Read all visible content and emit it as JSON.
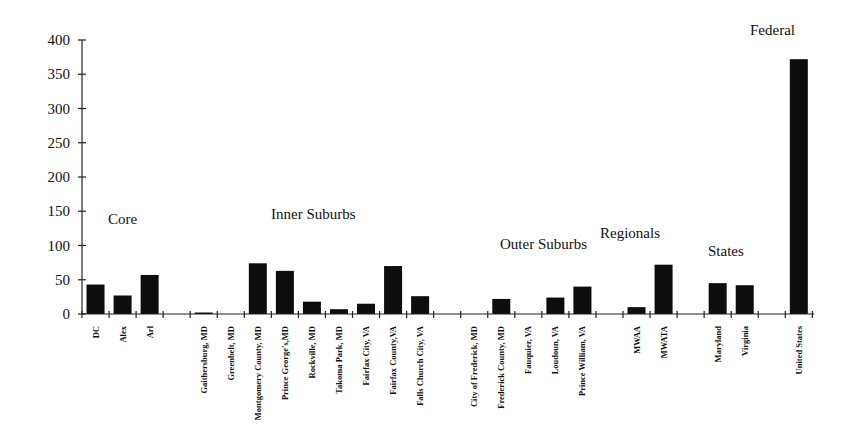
{
  "chart_data": {
    "type": "bar",
    "title": "",
    "xlabel": "",
    "ylabel": "",
    "ylim": [
      0,
      400
    ],
    "yticks": [
      0,
      50,
      100,
      150,
      200,
      250,
      300,
      350,
      400
    ],
    "grid": false,
    "legend": null,
    "categories": [
      "DC",
      "Alex",
      "Arl",
      "",
      "Gaithersburg, MD",
      "Greenbelt, MD",
      "Montgomery County, MD",
      "Prince George's,MD",
      "Rockville, MD",
      "Takoma Park, MD",
      "Fairfax City, VA",
      "Fairfax County,VA",
      "Falls Church City, VA",
      "",
      "City of Frederick, MD",
      "Frederick County, MD",
      "Fauquier, VA",
      "Loudoun, VA",
      "Prince William, VA",
      "",
      "MWAA",
      "MWATA",
      "",
      "Maryland",
      "Virginia",
      "",
      "United States"
    ],
    "values": [
      43,
      27,
      57,
      null,
      1,
      0,
      74,
      63,
      18,
      7,
      15,
      70,
      26,
      null,
      0,
      22,
      0,
      24,
      40,
      null,
      10,
      72,
      null,
      45,
      42,
      null,
      372
    ],
    "groups": [
      {
        "label": "Core",
        "categories": [
          "DC",
          "Alex",
          "Arl"
        ]
      },
      {
        "label": "Inner Suburbs",
        "categories": [
          "Gaithersburg, MD",
          "Greenbelt, MD",
          "Montgomery County, MD",
          "Prince George's,MD",
          "Rockville, MD",
          "Takoma Park, MD",
          "Fairfax City, VA",
          "Fairfax County,VA",
          "Falls Church City, VA"
        ]
      },
      {
        "label": "Outer Suburbs",
        "categories": [
          "City of Frederick, MD",
          "Frederick County, MD",
          "Fauquier, VA",
          "Loudoun, VA",
          "Prince William, VA"
        ]
      },
      {
        "label": "Regionals",
        "categories": [
          "MWAA",
          "MWATA"
        ]
      },
      {
        "label": "States",
        "categories": [
          "Maryland",
          "Virginia"
        ]
      },
      {
        "label": "Federal",
        "categories": [
          "United States"
        ]
      }
    ]
  },
  "labels": {
    "core": "Core",
    "inner": "Inner Suburbs",
    "outer": "Outer Suburbs",
    "regionals": "Regionals",
    "states": "States",
    "federal": "Federal"
  }
}
